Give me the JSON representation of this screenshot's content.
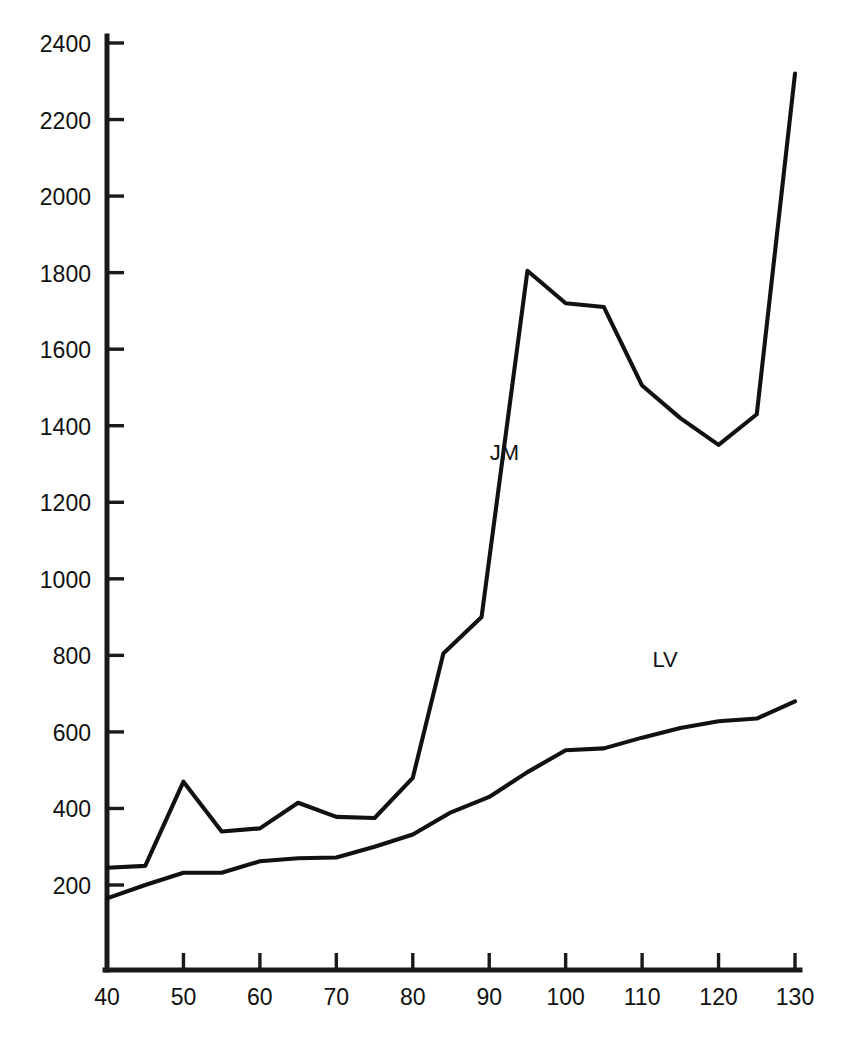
{
  "caption_top": "",
  "caption_bottom": "",
  "labels": {
    "jm": "JM",
    "lv": "LV"
  },
  "chart_data": {
    "type": "line",
    "title": "",
    "subtitle": "",
    "xlabel": "",
    "ylabel": "",
    "xlim": [
      40,
      133
    ],
    "ylim": [
      0,
      2480
    ],
    "xticks": [
      40,
      50,
      60,
      70,
      80,
      90,
      100,
      110,
      120,
      130
    ],
    "yticks": [
      200,
      400,
      600,
      800,
      1000,
      1200,
      1400,
      1600,
      1800,
      2000,
      2200,
      2400
    ],
    "xtick_labels": [
      "40",
      "50",
      "60",
      "70",
      "80",
      "90",
      "100",
      "110",
      "120",
      "130"
    ],
    "ytick_labels": [
      "200",
      "400",
      "600",
      "800",
      "1000",
      "1200",
      "1400",
      "1600",
      "1800",
      "2000",
      "2200",
      "2400"
    ],
    "grid": false,
    "legend": "inline-annotation",
    "legend_position": "inline",
    "line_color": "#111111",
    "series": [
      {
        "name": "JM",
        "label_position": {
          "x": 92,
          "y": 1310
        },
        "x": [
          40,
          45,
          50,
          55,
          60,
          65,
          70,
          75,
          80,
          84,
          89,
          95,
          100,
          105,
          110,
          115,
          120,
          125,
          130
        ],
        "y": [
          245,
          250,
          470,
          340,
          348,
          415,
          378,
          375,
          480,
          805,
          900,
          1805,
          1720,
          1710,
          1505,
          1420,
          1350,
          1430,
          2320
        ]
      },
      {
        "name": "LV",
        "label_position": {
          "x": 113,
          "y": 770
        },
        "x": [
          40,
          45,
          50,
          55,
          60,
          65,
          70,
          75,
          80,
          85,
          90,
          95,
          100,
          105,
          110,
          115,
          120,
          125,
          130
        ],
        "y": [
          165,
          200,
          232,
          232,
          262,
          270,
          272,
          300,
          332,
          390,
          430,
          495,
          552,
          557,
          585,
          610,
          628,
          635,
          680
        ]
      }
    ]
  }
}
